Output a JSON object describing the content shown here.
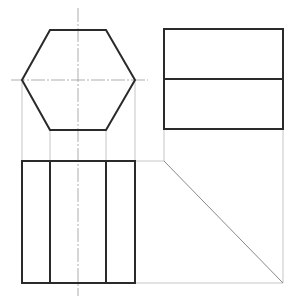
{
  "drawing": {
    "title": "Orthographic projection of a hexagonal prism",
    "views": {
      "top_view": {
        "shape": "hexagon",
        "points": [
          [
            22,
            80
          ],
          [
            50,
            30
          ],
          [
            106,
            30
          ],
          [
            135,
            80
          ],
          [
            106,
            130
          ],
          [
            50,
            130
          ]
        ],
        "center": [
          78,
          80
        ]
      },
      "side_view": {
        "shape": "rectangle-split",
        "rect": {
          "x": 164,
          "y": 29,
          "w": 119,
          "h": 100
        },
        "divider_y": 79
      },
      "front_view": {
        "shape": "rectangle-with-edges",
        "rect": {
          "x": 22,
          "y": 161,
          "w": 113,
          "h": 122
        },
        "edge_x": [
          50,
          106
        ]
      }
    },
    "center_lines": [
      {
        "x1": 78,
        "y1": 8,
        "x2": 78,
        "y2": 296
      },
      {
        "x1": 11,
        "y1": 80,
        "x2": 148,
        "y2": 80
      }
    ],
    "projection_lines": [
      {
        "x1": 22,
        "y1": 80,
        "x2": 22,
        "y2": 161
      },
      {
        "x1": 50,
        "y1": 130,
        "x2": 50,
        "y2": 161
      },
      {
        "x1": 106,
        "y1": 130,
        "x2": 106,
        "y2": 161
      },
      {
        "x1": 135,
        "y1": 80,
        "x2": 135,
        "y2": 161
      },
      {
        "x1": 135,
        "y1": 161,
        "x2": 164,
        "y2": 161
      },
      {
        "x1": 164,
        "y1": 129,
        "x2": 164,
        "y2": 161
      },
      {
        "x1": 283,
        "y1": 129,
        "x2": 283,
        "y2": 283
      },
      {
        "x1": 135,
        "y1": 283,
        "x2": 283,
        "y2": 283
      }
    ],
    "miter_line": {
      "x1": 164,
      "y1": 161,
      "x2": 283,
      "y2": 283
    },
    "colors": {
      "outline": "#2a2a2a",
      "construction": "#b8b8b8",
      "center": "#9a9a9a",
      "background": "#ffffff"
    }
  }
}
